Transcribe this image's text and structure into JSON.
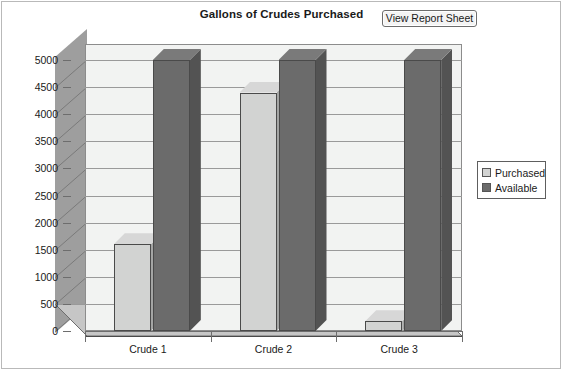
{
  "chart_data": {
    "type": "bar",
    "title": "Gallons of Crudes Purchased",
    "xlabel": "",
    "ylabel": "",
    "categories": [
      "Crude 1",
      "Crude 2",
      "Crude 3"
    ],
    "series": [
      {
        "name": "Purchased",
        "values": [
          1600,
          4400,
          180
        ],
        "color": "#d2d3d2"
      },
      {
        "name": "Available",
        "values": [
          5000,
          5000,
          5000
        ],
        "color": "#6b6b6b"
      }
    ],
    "ylim": [
      0,
      5000
    ],
    "ytick_labels": [
      "5000",
      "4500",
      "4000",
      "3500",
      "3000",
      "2500",
      "2000",
      "1500",
      "1000",
      "500",
      "0"
    ],
    "ytick_values": [
      5000,
      4500,
      4000,
      3500,
      3000,
      2500,
      2000,
      1500,
      1000,
      500,
      0
    ],
    "grid": true,
    "legend_position": "right",
    "style": "3d-column",
    "plot_background": "#f2f3f2",
    "floor_color": "#c6c6c6",
    "wall_color": "#9e9e9e"
  },
  "toolbar": {
    "view_report_label": "View Report Sheet"
  },
  "legend": {
    "entries": [
      {
        "label": "Purchased",
        "color": "#d2d3d2"
      },
      {
        "label": "Available",
        "color": "#6b6b6b"
      }
    ]
  }
}
